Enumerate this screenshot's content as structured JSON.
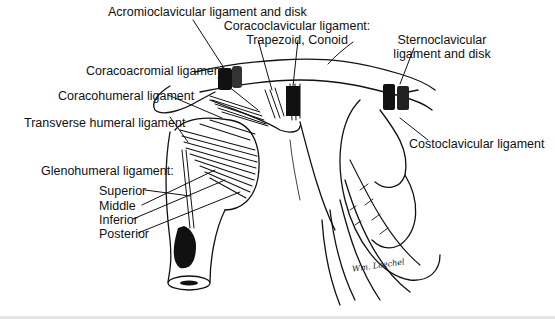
{
  "figure": {
    "labels": {
      "acromioclavicular": "Acromioclavicular ligament and disk",
      "coracoclavicular_line1": "Coracoclavicular ligament:",
      "coracoclavicular_line2": "Trapezoid, Conoid",
      "sternoclavicular_line1": "Sternoclavicular",
      "sternoclavicular_line2": "ligament and disk",
      "coracoacromial": "Coracoacromial ligament",
      "coracohumeral": "Coracohumeral ligament",
      "transverse_humeral": "Transverse humeral ligament",
      "costoclavicular": "Costoclavicular ligament",
      "glenohumeral_heading": "Glenohumeral ligament:",
      "glenohumeral_superior": "Superior",
      "glenohumeral_middle": "Middle",
      "glenohumeral_inferior": "Inferior",
      "glenohumeral_posterior": "Posterior"
    },
    "signature": "Wm. Loechel"
  }
}
